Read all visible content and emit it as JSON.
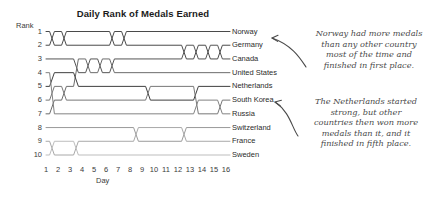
{
  "chart_data": {
    "type": "line",
    "title": "Daily Rank of Medals Earned",
    "xlabel": "Day",
    "ylabel": "Rank",
    "x": [
      1,
      2,
      3,
      4,
      5,
      6,
      7,
      8,
      9,
      10,
      11,
      12,
      13,
      14,
      15,
      16
    ],
    "xtick_labels": [
      "1",
      "2",
      "3",
      "4",
      "5",
      "6",
      "7",
      "8",
      "9",
      "10",
      "11",
      "12",
      "13",
      "14",
      "15",
      "16"
    ],
    "ytick_labels": [
      "1",
      "2",
      "3",
      "4",
      "5",
      "6",
      "7",
      "8",
      "9",
      "10"
    ],
    "ylim": [
      1,
      10
    ],
    "y_inverted": true,
    "grid": false,
    "legend_position": "right-inline-labels",
    "series": [
      {
        "name": "Norway",
        "color": "#4a4a4a",
        "values": [
          1,
          2,
          1,
          1,
          1,
          1,
          2,
          1,
          1,
          1,
          1,
          1,
          1,
          1,
          1,
          1
        ]
      },
      {
        "name": "Germany",
        "color": "#4a4a4a",
        "values": [
          2,
          1,
          2,
          2,
          2,
          2,
          1,
          2,
          2,
          2,
          2,
          2,
          3,
          2,
          3,
          2
        ]
      },
      {
        "name": "Canada",
        "color": "#555555",
        "values": [
          3,
          3,
          3,
          4,
          3,
          4,
          3,
          3,
          3,
          3,
          3,
          3,
          2,
          3,
          2,
          3
        ]
      },
      {
        "name": "United States",
        "color": "#6b6b6b",
        "values": [
          7,
          6,
          5,
          3,
          4,
          3,
          4,
          4,
          4,
          4,
          4,
          4,
          4,
          4,
          4,
          4
        ]
      },
      {
        "name": "Netherlands",
        "color": "#3f3f3f",
        "values": [
          5,
          4,
          4,
          5,
          5,
          5,
          5,
          5,
          5,
          6,
          6,
          6,
          6,
          5,
          5,
          5
        ]
      },
      {
        "name": "South Korea",
        "color": "#777777",
        "values": [
          6,
          5,
          6,
          6,
          6,
          6,
          6,
          6,
          6,
          5,
          5,
          5,
          5,
          7,
          7,
          6
        ]
      },
      {
        "name": "Russia",
        "color": "#828282",
        "values": [
          4,
          7,
          7,
          7,
          7,
          7,
          7,
          7,
          7,
          7,
          7,
          7,
          7,
          6,
          6,
          7
        ]
      },
      {
        "name": "Switzerland",
        "color": "#9a9a9a",
        "values": [
          8,
          8,
          8,
          8,
          8,
          8,
          8,
          8,
          9,
          9,
          9,
          9,
          8,
          8,
          8,
          8
        ]
      },
      {
        "name": "France",
        "color": "#a8a8a8",
        "values": [
          9,
          10,
          10,
          9,
          9,
          9,
          9,
          9,
          8,
          8,
          8,
          8,
          9,
          9,
          9,
          9
        ]
      },
      {
        "name": "Sweden",
        "color": "#bdbdbd",
        "values": [
          10,
          9,
          9,
          10,
          10,
          10,
          10,
          10,
          10,
          10,
          10,
          10,
          10,
          10,
          10,
          10
        ]
      }
    ],
    "annotations": [
      {
        "id": "norway",
        "text": "Norway had more medals\nthan any other country\nmost of the time and\nfinished in first place.",
        "points_to": "Norway"
      },
      {
        "id": "netherlands",
        "text": "The Netherlands started\nstrong, but other\ncountries then won more\nmedals than it, and it\nfinished in fifth place.",
        "points_to": "Netherlands"
      }
    ]
  }
}
